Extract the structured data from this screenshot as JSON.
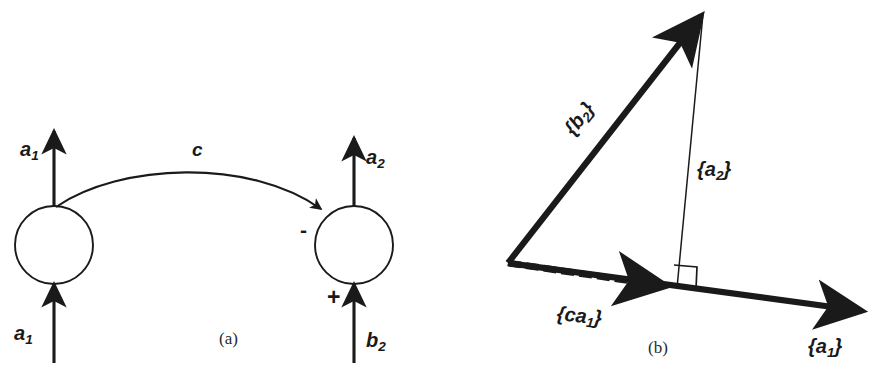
{
  "figure": {
    "width": 887,
    "height": 377,
    "background": "#ffffff",
    "ink_color": "#1a1a1a"
  },
  "panel_a": {
    "caption": "(a)",
    "nodes": [
      {
        "id": "node-left",
        "cx": 54,
        "cy": 245,
        "r": 39
      },
      {
        "id": "node-right",
        "cx": 354,
        "cy": 245,
        "r": 39
      }
    ],
    "labels": {
      "left_output": "a",
      "left_output_sub": "1",
      "left_input": "a",
      "left_input_sub": "1",
      "right_output": "a",
      "right_output_sub": "2",
      "right_input": "b",
      "right_input_sub": "2",
      "gain": "c"
    },
    "signs": {
      "negative": "-",
      "positive": "+"
    }
  },
  "panel_b": {
    "caption": "(b)",
    "vectors": [
      {
        "id": "vec-b2",
        "label": "{b",
        "label_sub": "2",
        "label_close": "}",
        "style": "thick-solid",
        "from": [
          508,
          263
        ],
        "to": [
          705,
          10
        ]
      },
      {
        "id": "vec-a1",
        "label": "{a",
        "label_sub": "1",
        "label_close": "}",
        "style": "thick-solid",
        "from": [
          508,
          263
        ],
        "to": [
          870,
          312
        ]
      },
      {
        "id": "vec-ca1",
        "label": "{ca",
        "label_sub": "1",
        "label_close": "}",
        "style": "thick-hatched",
        "from": [
          508,
          263
        ],
        "to": [
          673,
          287
        ]
      },
      {
        "id": "vec-a2",
        "label": "{a",
        "label_sub": "2",
        "label_close": "}",
        "style": "thin-solid",
        "from": [
          705,
          10
        ],
        "to": [
          677,
          288
        ]
      }
    ],
    "right_angle_marker": {
      "present": true,
      "at": [
        677,
        288
      ]
    }
  }
}
